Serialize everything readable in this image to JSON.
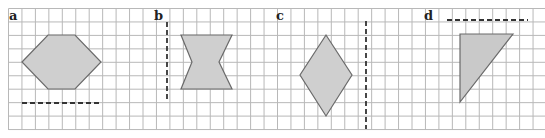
{
  "panels": [
    {
      "label": "a",
      "shape": "hexagon",
      "mirror_line": "horizontal-dashed"
    },
    {
      "label": "b",
      "shape": "bowtie",
      "mirror_line": "vertical-dashed"
    },
    {
      "label": "c",
      "shape": "rhombus",
      "mirror_line": "vertical-dashed"
    },
    {
      "label": "d",
      "shape": "right-triangle",
      "mirror_line": "horizontal-dashed"
    }
  ],
  "colors": {
    "grid": "#b5b5b5",
    "shape_fill": "#cfcfcf",
    "shape_stroke": "#6a6a6a",
    "dash": "#333333"
  }
}
